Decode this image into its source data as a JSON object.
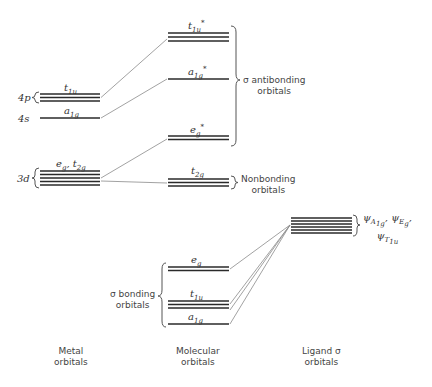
{
  "diagram": {
    "type": "molecular orbital energy level diagram",
    "columns": {
      "metal": {
        "line1": "Metal",
        "line2": "orbitals"
      },
      "molecular": {
        "line1": "Molecular",
        "line2": "orbitals"
      },
      "ligand": {
        "line1": "Ligand σ",
        "line2": "orbitals"
      }
    },
    "metal_levels": {
      "p4": {
        "shell": "4p",
        "label_main": "t",
        "label_sub": "1u"
      },
      "s4": {
        "shell": "4s",
        "label_main": "a",
        "label_sub": "1g"
      },
      "d3": {
        "shell": "3d",
        "label_text": "e",
        "label_sub1": "g",
        "label_mid": ", t",
        "label_sub2": "2g"
      }
    },
    "mo_levels": {
      "t1u_star": {
        "label_main": "t",
        "label_sub": "1u",
        "label_sup": "*"
      },
      "a1g_star": {
        "label_main": "a",
        "label_sub": "1g",
        "label_sup": "*"
      },
      "eg_star": {
        "label_main": "e",
        "label_sub": "g",
        "label_sup": "*"
      },
      "t2g": {
        "label_main": "t",
        "label_sub": "2g"
      },
      "eg": {
        "label_main": "e",
        "label_sub": "g"
      },
      "t1u": {
        "label_main": "t",
        "label_sub": "1u"
      },
      "a1g": {
        "label_main": "a",
        "label_sub": "1g"
      }
    },
    "groups": {
      "antibonding": {
        "line1": "σ antibonding",
        "line2": "orbitals"
      },
      "nonbonding": {
        "line1": "Nonbonding",
        "line2": "orbitals"
      },
      "bonding": {
        "line1": "σ bonding",
        "line2": "orbitals"
      }
    },
    "ligand_label": {
      "psi": "ψ",
      "a_sub": "A",
      "a_subsub": "1g",
      "e_sub": "E",
      "e_subsub": "g",
      "t_sub": "T",
      "t_subsub": "1u",
      "sep": ", "
    }
  }
}
